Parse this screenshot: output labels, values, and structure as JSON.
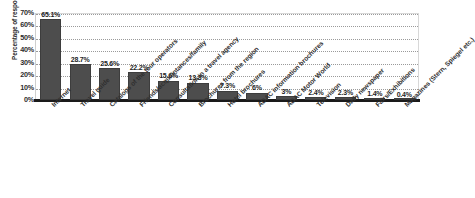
{
  "chart_data": {
    "type": "bar",
    "title": "",
    "xlabel": "",
    "ylabel": "Percentage of respondents",
    "ylim": [
      0,
      70
    ],
    "grid": true,
    "legend": "none",
    "orientation": "vertical",
    "bar_color": "#4d4d4d",
    "categories": [
      "Internet",
      "Travel guide",
      "Catalogs of the tour operators",
      "Friends/acquaintances/family",
      "Consultation in a travel agency",
      "Brochures from the region",
      "Hotel brochures",
      "ADAC information brochures",
      "ADAC Motor World",
      "Television",
      "Daily newspaper",
      "Fairs/Exhibitions",
      "Magazines (Stern, Spiegel etc.)"
    ],
    "values": [
      65.1,
      28.7,
      25.6,
      22.2,
      15.6,
      13.8,
      7.3,
      6,
      3,
      2.4,
      2.3,
      1.4,
      0.4
    ],
    "data_labels": [
      "65.1%",
      "28.7%",
      "25.6%",
      "22.2%",
      "15.6%",
      "13.8%",
      "7.3%",
      "6%",
      "3%",
      "2.4%",
      "2.3%",
      "1.4%",
      "0.4%"
    ],
    "ytick_labels": [
      "70%",
      "60%",
      "50%",
      "40%",
      "30%",
      "20%",
      "10%",
      "0%"
    ],
    "ytick_values": [
      70,
      60,
      50,
      40,
      30,
      20,
      10,
      0
    ]
  }
}
